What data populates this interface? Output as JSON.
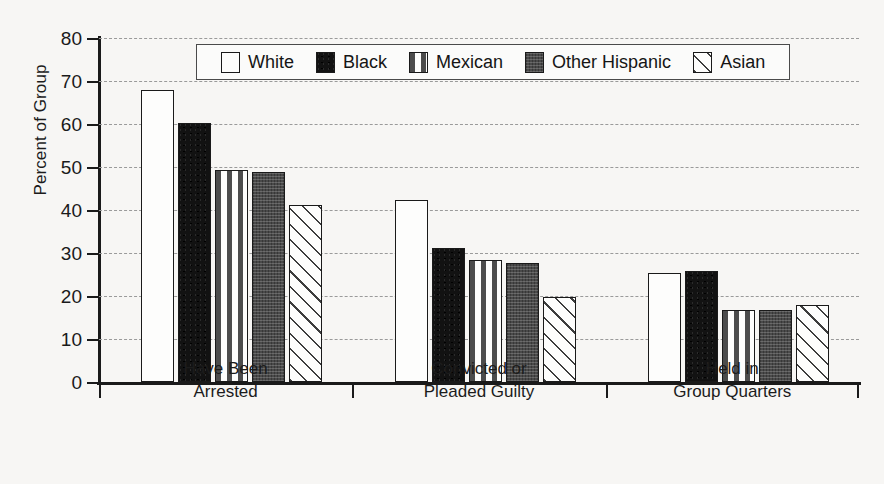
{
  "chart_data": {
    "type": "bar",
    "title": "",
    "subtitle": "",
    "xlabel": "",
    "ylabel": "Percent of Group",
    "ylim": [
      0,
      80
    ],
    "ytick_step": 10,
    "yticks": [
      80,
      70,
      60,
      50,
      40,
      30,
      20,
      10,
      0
    ],
    "grid": true,
    "grid_style": "dashed-horizontal",
    "legend_position": "top-center-inside",
    "categories": [
      "Have Been\nArrested",
      "Convicted or\nPleaded Guilty",
      "Held in\nGroup Quarters"
    ],
    "category_lines": [
      [
        "Have Been",
        "Arrested"
      ],
      [
        "Convicted or",
        "Pleaded Guilty"
      ],
      [
        "Held in",
        "Group Quarters"
      ]
    ],
    "series": [
      {
        "name": "White",
        "pattern": "solid-white",
        "values": [
          68.0,
          42.3,
          25.3
        ]
      },
      {
        "name": "Black",
        "pattern": "solid-black",
        "values": [
          60.3,
          31.1,
          25.8
        ]
      },
      {
        "name": "Mexican",
        "pattern": "dashed-brick",
        "values": [
          49.2,
          28.3,
          16.8
        ]
      },
      {
        "name": "Other Hispanic",
        "pattern": "solid-dark-gray",
        "values": [
          48.9,
          27.7,
          16.8
        ]
      },
      {
        "name": "Asian",
        "pattern": "diagonal-hatch",
        "values": [
          41.2,
          19.7,
          18.0
        ]
      }
    ]
  },
  "legend": {
    "items": [
      {
        "label": "White"
      },
      {
        "label": "Black"
      },
      {
        "label": "Mexican"
      },
      {
        "label": "Other Hispanic"
      },
      {
        "label": "Asian"
      }
    ]
  },
  "colors": {
    "background": "#f7f6f4",
    "axis": "#1a1a1a",
    "gridline": "#9a9a9a",
    "white_series": "#fdfdfc",
    "black_series": "#121212",
    "mexican_series": "#fdfdfc",
    "other_hispanic_series": "#4a4a4a",
    "asian_series": "#fdfdfc"
  }
}
